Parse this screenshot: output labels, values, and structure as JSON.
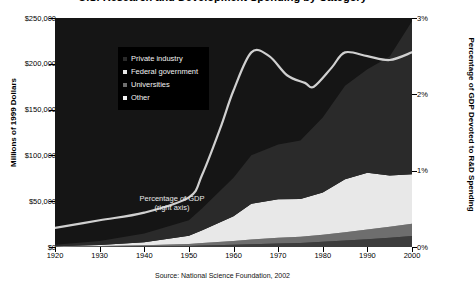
{
  "title": "U.S. Research and Development Spending by Category",
  "caption": "Source: National Science Foundation, 2002",
  "axes": {
    "left_title": "Millions of 1999 Dollars",
    "right_title": "Percentage of GDP Devoted to R&D Spending",
    "y_ticks": [
      "$0",
      "$50,000",
      "$100,000",
      "$150,000",
      "$200,000",
      "$250,000"
    ],
    "y_tick_values": [
      0,
      50000,
      100000,
      150000,
      200000,
      250000
    ],
    "r_ticks": [
      "0%",
      "1%",
      "2%",
      "3%"
    ],
    "r_tick_values": [
      0,
      1,
      2,
      3
    ],
    "x_ticks": [
      "1920",
      "1930",
      "1940",
      "1950",
      "1960",
      "1970",
      "1980",
      "1990",
      "2000"
    ],
    "x_tick_values": [
      1920,
      1930,
      1940,
      1950,
      1960,
      1970,
      1980,
      1990,
      2000
    ]
  },
  "legend": {
    "items": [
      {
        "label": "Private industry",
        "color": "#2a2a2a"
      },
      {
        "label": "Federal government",
        "color": "#e8e8e8"
      },
      {
        "label": "Universities",
        "color": "#6e6e6e"
      },
      {
        "label": "Other",
        "color": "#f2f2f2"
      }
    ]
  },
  "annotation": {
    "line1": "Percentage of GDP",
    "line2": "(right axis)"
  },
  "colors": {
    "plot_background": "#151515",
    "private_industry": "#2a2a2a",
    "federal_government": "#e8e8e8",
    "universities": "#6e6e6e",
    "other": "#3d3d3d",
    "gdp_line": "#d0d0d0",
    "legend_background": "#000000",
    "axis": "#000000"
  },
  "chart_data": {
    "type": "area",
    "title": "U.S. Research and Development Spending by Category",
    "xlabel": "",
    "ylabel": "Millions of 1999 Dollars",
    "y2label": "Percentage of GDP Devoted to R&D Spending",
    "xlim": [
      1920,
      2000
    ],
    "ylim": [
      0,
      250000
    ],
    "y2lim": [
      0,
      3
    ],
    "grid": false,
    "legend_position": "upper-left-inside",
    "stacked": true,
    "stack_order_bottom_to_top": [
      "Other",
      "Universities",
      "Federal government",
      "Private industry"
    ],
    "x": [
      1920,
      1930,
      1940,
      1950,
      1953,
      1960,
      1964,
      1970,
      1975,
      1980,
      1985,
      1990,
      1995,
      2000
    ],
    "series": [
      {
        "name": "Other",
        "color": "#3d3d3d",
        "values": [
          200,
          400,
          700,
          1200,
          1600,
          2400,
          3000,
          3800,
          4500,
          5600,
          7000,
          8500,
          10000,
          12000
        ]
      },
      {
        "name": "Universities",
        "color": "#6e6e6e",
        "values": [
          300,
          600,
          1100,
          2000,
          2800,
          4200,
          5200,
          6200,
          6800,
          7800,
          9000,
          10500,
          12000,
          13500
        ]
      },
      {
        "name": "Federal government",
        "color": "#e8e8e8",
        "values": [
          400,
          1100,
          3500,
          9000,
          14000,
          27000,
          39000,
          42000,
          41000,
          46000,
          58000,
          62000,
          56000,
          54000
        ]
      },
      {
        "name": "Private industry",
        "color": "#2a2a2a",
        "values": [
          1600,
          4400,
          9500,
          17000,
          24000,
          42000,
          53000,
          60000,
          64000,
          82000,
          102000,
          113000,
          130000,
          167000
        ]
      }
    ],
    "overlay_line": {
      "name": "Percentage of GDP",
      "axis": "right",
      "color": "#d0d0d0",
      "x": [
        1920,
        1930,
        1940,
        1950,
        1953,
        1957,
        1960,
        1964,
        1968,
        1972,
        1976,
        1978,
        1982,
        1985,
        1990,
        1995,
        2000
      ],
      "values": [
        0.25,
        0.35,
        0.45,
        0.65,
        0.95,
        1.55,
        2.05,
        2.55,
        2.5,
        2.25,
        2.15,
        2.1,
        2.35,
        2.55,
        2.5,
        2.45,
        2.55
      ]
    }
  }
}
